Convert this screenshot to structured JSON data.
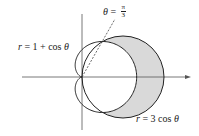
{
  "figure": {
    "type": "polar-region-diagram",
    "curves": [
      {
        "name": "cardioid",
        "equation": "r = 1 + cos θ",
        "label_var": "r",
        "label_rest": " = 1 + cos ",
        "label_theta": "θ"
      },
      {
        "name": "circle",
        "equation": "r = 3 cos θ",
        "label_var": "r",
        "label_rest": " = 3 cos ",
        "label_theta": "θ"
      }
    ],
    "ray": {
      "label_lhs": "θ",
      "label_eq": " = ",
      "numerator": "π",
      "denominator": "3",
      "angle": "π/3"
    },
    "shaded_region": "inside r = 3 cos θ and outside r = 1 + cos θ",
    "colors": {
      "stroke": "#222222",
      "shade": "#d9d9d9",
      "axis": "#555555",
      "background": "#ffffff"
    }
  }
}
